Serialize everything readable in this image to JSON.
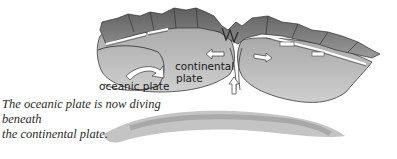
{
  "labels": {
    "oceanic_plate": "oceanic plate",
    "continental_plate_line1": "continental",
    "continental_plate_line2": "plate"
  },
  "caption": {
    "line1": "The oceanic plate is now diving beneath",
    "line2": "the continental plate."
  },
  "arrows": {
    "oceanic_curve": "curved-arrow-right",
    "continental_left": "arrow-left",
    "right_plate": "arrow-right",
    "magma_up": "arrow-up"
  },
  "colors": {
    "plate_fill": "#b9b9b9",
    "plate_dark": "#8a8a8a",
    "mountain": "#7d7d7d",
    "outline": "#3a3a3a",
    "arrow_fill": "#ffffff"
  }
}
